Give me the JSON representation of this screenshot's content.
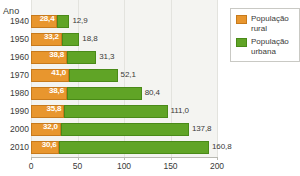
{
  "axis_title": "Ano",
  "legend": {
    "items": [
      {
        "label": "População\nrural",
        "color": "#e8962e",
        "key": "rural"
      },
      {
        "label": "População\nurbana",
        "color": "#60a426",
        "key": "urbana"
      }
    ]
  },
  "xticks": [
    "0",
    "50",
    "100",
    "150",
    "200"
  ],
  "rows": [
    {
      "year": "1940",
      "rural": "28,4",
      "urbana": "12,9"
    },
    {
      "year": "1950",
      "rural": "33,2",
      "urbana": "18,8"
    },
    {
      "year": "1960",
      "rural": "38,8",
      "urbana": "31,3"
    },
    {
      "year": "1970",
      "rural": "41,0",
      "urbana": "52,1"
    },
    {
      "year": "1980",
      "rural": "38,6",
      "urbana": "80,4"
    },
    {
      "year": "1990",
      "rural": "35,8",
      "urbana": "111,0"
    },
    {
      "year": "2000",
      "rural": "32,0",
      "urbana": "137,8"
    },
    {
      "year": "2010",
      "rural": "30,6",
      "urbana": "160,8"
    }
  ],
  "chart_data": {
    "type": "bar",
    "orientation": "horizontal",
    "stacked": true,
    "title": "",
    "xlabel": "",
    "ylabel": "Ano",
    "categories": [
      "1940",
      "1950",
      "1960",
      "1970",
      "1980",
      "1990",
      "2000",
      "2010"
    ],
    "series": [
      {
        "name": "População rural",
        "color": "#e8962e",
        "values": [
          28.4,
          33.2,
          38.8,
          41.0,
          38.6,
          35.8,
          32.0,
          30.6
        ]
      },
      {
        "name": "População urbana",
        "color": "#60a426",
        "values": [
          12.9,
          18.8,
          31.3,
          52.1,
          80.4,
          111.0,
          137.8,
          160.8
        ]
      }
    ],
    "xlim": [
      0,
      200
    ],
    "xticks": [
      0,
      50,
      100,
      150,
      200
    ],
    "grid": true,
    "legend_position": "top-right"
  }
}
